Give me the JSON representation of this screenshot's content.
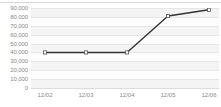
{
  "chart_data": {
    "type": "line",
    "title": "",
    "subtitle": "",
    "xlabel": "",
    "ylabel": "",
    "categories": [
      "12/02",
      "12/03",
      "12/04",
      "12/05",
      "12/06"
    ],
    "values": [
      40000,
      40000,
      40000,
      81000,
      88000
    ],
    "series": [
      {
        "name": "series-1",
        "values": [
          40000,
          40000,
          40000,
          81000,
          88000
        ]
      }
    ],
    "ylim": [
      0,
      90000
    ],
    "y_ticks": [
      "90,000",
      "80,000",
      "70,000",
      "60,000",
      "50,000",
      "40,000",
      "30,000",
      "20,000",
      "10,000",
      "0"
    ],
    "y_tick_values": [
      90000,
      80000,
      70000,
      60000,
      50000,
      40000,
      30000,
      20000,
      10000,
      0
    ],
    "x_ticks": [
      "12/02",
      "12/03",
      "12/04",
      "12/05",
      "12/06"
    ],
    "grid": true,
    "grid_orientation": "horizontal",
    "legend": false,
    "legend_position": "none",
    "marker": "open-square",
    "annotations": []
  },
  "style": {
    "line_color": "#333333",
    "marker_fill": "#ffffff",
    "marker_stroke": "#555555",
    "gridline_color": "#e6e6e6",
    "band_color": "#f4f4f4",
    "plot_background": "#fdfdfd",
    "page_background": "#ffffff",
    "tick_label_color": "#8a8a8a",
    "border_color": "#d8d8d8"
  }
}
